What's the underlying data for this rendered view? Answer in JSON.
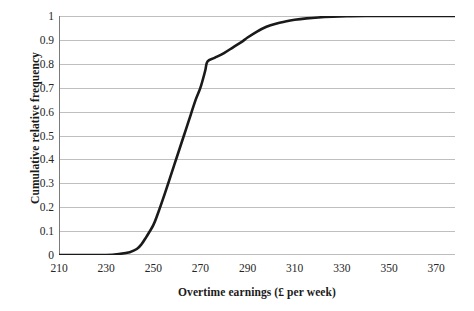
{
  "chart_data": {
    "type": "line",
    "title": "",
    "subtitle": "",
    "xlabel": "Overtime earnings (£ per week)",
    "ylabel": "Cumulative relative frequency",
    "xlim": [
      210,
      378
    ],
    "ylim": [
      0,
      1
    ],
    "xticks": [
      210,
      230,
      250,
      270,
      290,
      310,
      330,
      350,
      370
    ],
    "yticks": [
      0,
      0.1,
      0.2,
      0.3,
      0.4,
      0.5,
      0.6,
      0.7,
      0.8,
      0.9,
      1
    ],
    "xtick_labels": [
      "210",
      "230",
      "250",
      "270",
      "290",
      "310",
      "330",
      "350",
      "370"
    ],
    "ytick_labels": [
      "0",
      "0.1",
      "0.2",
      "0.3",
      "0.4",
      "0.5",
      "0.6",
      "0.7",
      "0.8",
      "0.9",
      "1"
    ],
    "grid": "horizontal",
    "legend": "none",
    "annotations": [],
    "series": [
      {
        "name": "Cumulative relative frequency",
        "color": "#1a1a1a",
        "line_width": 2.6,
        "x": [
          210,
          220,
          230,
          236,
          240,
          243,
          245,
          247,
          250,
          252,
          255,
          258,
          260,
          263,
          265,
          268,
          270,
          272,
          273,
          276,
          280,
          284,
          288,
          290,
          294,
          298,
          302,
          306,
          310,
          315,
          320,
          326,
          332,
          340,
          350,
          360,
          370,
          378
        ],
        "y": [
          0.0,
          0.0,
          0.0,
          0.005,
          0.012,
          0.025,
          0.045,
          0.075,
          0.125,
          0.175,
          0.26,
          0.35,
          0.41,
          0.5,
          0.56,
          0.65,
          0.7,
          0.77,
          0.81,
          0.825,
          0.845,
          0.87,
          0.895,
          0.91,
          0.935,
          0.955,
          0.968,
          0.977,
          0.984,
          0.99,
          0.994,
          0.997,
          0.999,
          1.0,
          1.0,
          1.0,
          1.0,
          1.0
        ]
      }
    ]
  },
  "axes": {
    "gridline_color": "#bfbfbf",
    "axis_color": "#7a7a7a",
    "background": "#ffffff"
  }
}
